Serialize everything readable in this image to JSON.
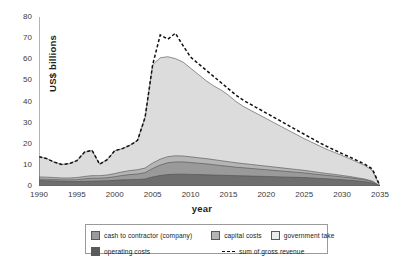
{
  "chart_data": {
    "type": "area",
    "stacked": true,
    "title": "",
    "xlabel": "year",
    "ylabel": "US$ billions",
    "xlim": [
      1990,
      2035
    ],
    "ylim": [
      0,
      80
    ],
    "ytick_step": 10,
    "xtick_step": 5,
    "grid": false,
    "legend_position": "bottom",
    "xticks": [
      "1990",
      "1995",
      "2000",
      "2005",
      "2010",
      "2015",
      "2020",
      "2025",
      "2030",
      "2035"
    ],
    "yticks": [
      "0",
      "10",
      "20",
      "30",
      "40",
      "50",
      "60",
      "70",
      "80"
    ],
    "x": [
      1990,
      1991,
      1992,
      1993,
      1994,
      1995,
      1996,
      1997,
      1998,
      1999,
      2000,
      2001,
      2002,
      2003,
      2004,
      2005,
      2006,
      2007,
      2008,
      2009,
      2010,
      2011,
      2012,
      2013,
      2014,
      2015,
      2016,
      2017,
      2018,
      2019,
      2020,
      2021,
      2022,
      2023,
      2024,
      2025,
      2026,
      2027,
      2028,
      2029,
      2030,
      2031,
      2032,
      2033,
      2034,
      2035
    ],
    "series": [
      {
        "name": "operating costs",
        "color": "#6e6e6e",
        "values": [
          2.6,
          2.5,
          2.4,
          2.2,
          2.1,
          2.1,
          2.2,
          2.3,
          2.4,
          2.5,
          2.7,
          2.9,
          3.0,
          3.1,
          3.3,
          4.3,
          5.0,
          5.4,
          5.6,
          5.6,
          5.5,
          5.4,
          5.3,
          5.2,
          5.1,
          5.0,
          4.9,
          4.8,
          4.7,
          4.6,
          4.5,
          4.4,
          4.3,
          4.2,
          4.1,
          4.0,
          3.8,
          3.6,
          3.4,
          3.2,
          3.0,
          2.7,
          2.4,
          2.0,
          1.4,
          0.0
        ]
      },
      {
        "name": "cash to contractor (company)",
        "color": "#9a9a9a",
        "values": [
          0.7,
          0.7,
          0.7,
          0.7,
          0.8,
          0.9,
          1.2,
          1.4,
          1.3,
          1.4,
          1.7,
          2.1,
          2.4,
          2.6,
          3.0,
          4.0,
          4.9,
          5.6,
          5.8,
          5.8,
          5.6,
          5.4,
          5.2,
          4.9,
          4.6,
          4.3,
          4.0,
          3.8,
          3.6,
          3.4,
          3.2,
          3.0,
          2.8,
          2.6,
          2.4,
          2.2,
          2.0,
          1.8,
          1.6,
          1.5,
          1.3,
          1.2,
          1.0,
          0.9,
          0.6,
          0.0
        ]
      },
      {
        "name": "capital costs",
        "color": "#b5b5b5",
        "values": [
          1.0,
          1.0,
          0.9,
          0.9,
          0.9,
          1.0,
          1.1,
          1.2,
          1.2,
          1.3,
          1.5,
          1.7,
          1.9,
          2.0,
          2.2,
          2.6,
          2.8,
          2.9,
          2.9,
          2.8,
          2.7,
          2.6,
          2.5,
          2.4,
          2.3,
          2.2,
          2.1,
          2.0,
          1.9,
          1.8,
          1.7,
          1.6,
          1.5,
          1.4,
          1.3,
          1.2,
          1.1,
          1.0,
          0.9,
          0.8,
          0.7,
          0.6,
          0.5,
          0.4,
          0.3,
          0.0
        ]
      },
      {
        "name": "government take",
        "color": "#dcdcdc",
        "values": [
          9.6,
          8.8,
          7.3,
          6.4,
          6.8,
          8.0,
          11.5,
          12.0,
          5.4,
          7.3,
          10.8,
          11.0,
          12.0,
          13.9,
          24.0,
          46.5,
          48.0,
          47.3,
          46.0,
          44.5,
          42.0,
          39.5,
          37.0,
          35.0,
          33.5,
          31.5,
          29.0,
          27.0,
          25.5,
          24.0,
          22.5,
          21.0,
          19.5,
          18.0,
          16.5,
          15.0,
          13.8,
          12.6,
          11.4,
          10.4,
          9.4,
          8.4,
          7.4,
          6.4,
          5.0,
          0.0
        ]
      },
      {
        "name": "sum of gross revenue",
        "style": "dashed-line",
        "color": "#111111",
        "values": [
          13.9,
          13.0,
          11.3,
          10.2,
          10.6,
          12.0,
          16.0,
          16.9,
          10.3,
          12.5,
          16.7,
          17.7,
          19.3,
          21.6,
          32.5,
          57.4,
          71.5,
          69.5,
          72.3,
          66.5,
          61.0,
          58.0,
          55.0,
          52.0,
          49.0,
          46.0,
          43.0,
          40.5,
          38.5,
          36.5,
          34.5,
          32.5,
          30.5,
          28.5,
          26.5,
          24.5,
          22.5,
          20.5,
          18.7,
          17.0,
          15.3,
          13.7,
          12.0,
          10.3,
          8.0,
          0.0
        ]
      }
    ]
  },
  "legend": {
    "items": [
      {
        "label": "cash to contractor (company)",
        "swatch": "#9a9a9a",
        "kind": "swatch"
      },
      {
        "label": "capital costs",
        "swatch": "#b5b5b5",
        "kind": "swatch"
      },
      {
        "label": "government take",
        "swatch": "#ececec",
        "kind": "swatch"
      },
      {
        "label": "operating costs",
        "swatch": "#5a5a5a",
        "kind": "swatch"
      },
      {
        "label": "sum of gross revenue",
        "swatch": "#111111",
        "kind": "dash"
      }
    ]
  }
}
